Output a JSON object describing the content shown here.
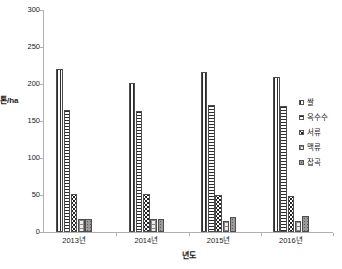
{
  "chart_data": {
    "type": "bar",
    "title": "",
    "subtitle": "",
    "xlabel": "년도",
    "ylabel": "톤/ha",
    "categories": [
      "2013년",
      "2014년",
      "2015년",
      "2016년"
    ],
    "series": [
      {
        "name": "쌀",
        "pattern": "vertical-stripes",
        "values": [
          220,
          202,
          216,
          210
        ]
      },
      {
        "name": "옥수수",
        "pattern": "horizontal-stripes",
        "values": [
          165,
          163,
          172,
          170
        ]
      },
      {
        "name": "서류",
        "pattern": "dots",
        "values": [
          52,
          52,
          50,
          48
        ]
      },
      {
        "name": "맥류",
        "pattern": "light-grid",
        "values": [
          17,
          17,
          15,
          15
        ]
      },
      {
        "name": "잡곡",
        "pattern": "grey-speckle",
        "values": [
          17,
          17,
          20,
          22
        ]
      }
    ],
    "ylim": [
      0,
      300
    ],
    "yticks": [
      0,
      50,
      100,
      150,
      200,
      250,
      300
    ],
    "ytick_labels": [
      "0",
      "50",
      "100",
      "150",
      "200",
      "250",
      "300"
    ],
    "grid": false,
    "legend_position": "right",
    "axis_color": "#b0b0b0",
    "text_color": "#1a1a1a"
  },
  "axes": {
    "y_title": "톤/ha",
    "y_title_chars": [
      "톤",
      "/",
      "h",
      "a"
    ],
    "x_title": "년도"
  },
  "legend": {
    "items": [
      {
        "label": "쌀"
      },
      {
        "label": "옥수수"
      },
      {
        "label": "서류"
      },
      {
        "label": "맥류"
      },
      {
        "label": "잡곡"
      }
    ]
  }
}
